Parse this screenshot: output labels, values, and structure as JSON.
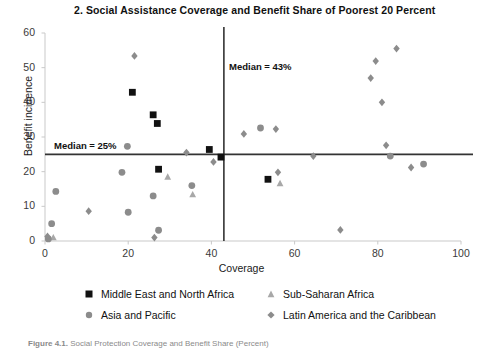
{
  "chart_data": {
    "type": "scatter",
    "title": "2. Social Assistance Coverage and Benefit Share of Poorest 20 Percent",
    "xlabel": "Coverage",
    "ylabel": "Benefit incidence",
    "xlim": [
      0,
      100
    ],
    "ylim": [
      0,
      60
    ],
    "xticks": [
      0,
      20,
      40,
      60,
      80,
      100
    ],
    "yticks": [
      0,
      10,
      20,
      30,
      40,
      50,
      60
    ],
    "grid": false,
    "legend_position": "below-plot",
    "reference_lines": [
      {
        "orientation": "horizontal",
        "value": 25,
        "label": "Median = 25%",
        "color": "#333333"
      },
      {
        "orientation": "vertical",
        "value": 43,
        "label": "Median = 43%",
        "color": "#333333"
      }
    ],
    "series": [
      {
        "name": "Middle East and North Africa",
        "marker": "square",
        "color": "#111111",
        "points": [
          {
            "x": 21.0,
            "y": 42.9
          },
          {
            "x": 26.0,
            "y": 36.4
          },
          {
            "x": 27.0,
            "y": 33.9
          },
          {
            "x": 27.3,
            "y": 20.7
          },
          {
            "x": 39.5,
            "y": 26.4
          },
          {
            "x": 42.3,
            "y": 24.2
          },
          {
            "x": 53.6,
            "y": 17.8
          }
        ]
      },
      {
        "name": "Sub-Saharan Africa",
        "marker": "triangle",
        "color": "#a8a8a8",
        "points": [
          {
            "x": 2.0,
            "y": 1.0
          },
          {
            "x": 29.5,
            "y": 18.5
          },
          {
            "x": 35.5,
            "y": 13.4
          },
          {
            "x": 56.5,
            "y": 16.6
          }
        ]
      },
      {
        "name": "Asia and Pacific",
        "marker": "circle",
        "color": "#8c8c8c",
        "points": [
          {
            "x": 0.8,
            "y": 0.6
          },
          {
            "x": 1.6,
            "y": 5.0
          },
          {
            "x": 2.6,
            "y": 14.3
          },
          {
            "x": 18.5,
            "y": 19.8
          },
          {
            "x": 19.8,
            "y": 27.3
          },
          {
            "x": 20.0,
            "y": 8.3
          },
          {
            "x": 26.0,
            "y": 13.0
          },
          {
            "x": 27.3,
            "y": 3.1
          },
          {
            "x": 35.3,
            "y": 16.0
          },
          {
            "x": 51.8,
            "y": 32.6
          },
          {
            "x": 83.0,
            "y": 24.5
          },
          {
            "x": 91.0,
            "y": 22.2
          }
        ]
      },
      {
        "name": "Latin America and the Caribbean",
        "marker": "diamond",
        "color": "#8c8c8c",
        "points": [
          {
            "x": 0.6,
            "y": 1.3
          },
          {
            "x": 10.5,
            "y": 8.6
          },
          {
            "x": 21.5,
            "y": 53.4
          },
          {
            "x": 26.3,
            "y": 1.0
          },
          {
            "x": 34.0,
            "y": 25.5
          },
          {
            "x": 40.5,
            "y": 22.8
          },
          {
            "x": 47.8,
            "y": 30.9
          },
          {
            "x": 55.5,
            "y": 32.3
          },
          {
            "x": 56.0,
            "y": 19.8
          },
          {
            "x": 64.5,
            "y": 24.5
          },
          {
            "x": 71.0,
            "y": 3.2
          },
          {
            "x": 78.3,
            "y": 47.0
          },
          {
            "x": 79.5,
            "y": 51.9
          },
          {
            "x": 81.0,
            "y": 40.0
          },
          {
            "x": 82.0,
            "y": 27.6
          },
          {
            "x": 84.5,
            "y": 55.5
          },
          {
            "x": 88.0,
            "y": 21.2
          }
        ]
      }
    ]
  },
  "legend": {
    "items": [
      {
        "label": "Middle East and North Africa",
        "marker": "square-marker",
        "color": "#111111"
      },
      {
        "label": "Asia and Pacific",
        "marker": "circle-marker",
        "color": "#8c8c8c"
      },
      {
        "label": "Sub-Saharan Africa",
        "marker": "triangle-marker",
        "color": "#a8a8a8"
      },
      {
        "label": "Latin America and the Caribbean",
        "marker": "diamond-marker",
        "color": "#8c8c8c"
      }
    ]
  },
  "caption": {
    "bold": "Figure 4.1.",
    "rest": "Social Protection Coverage and Benefit Share (Percent)"
  }
}
